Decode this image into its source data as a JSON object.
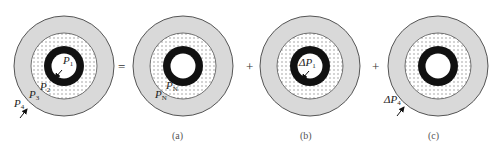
{
  "diagram": {
    "type": "superposition-of-pressures",
    "colors": {
      "outer_ring": "#d9d9d9",
      "outline": "#555555",
      "dotted_fill": "#ffffff",
      "dot": "#8a8a8a",
      "casing": "#111111",
      "bore": "#ffffff"
    },
    "operators": {
      "equals": "=",
      "plus1": "+",
      "plus2": "+"
    },
    "figures": [
      {
        "id": "original",
        "caption": "",
        "labels": {
          "inner": {
            "main": "P",
            "sub": "1"
          },
          "casing_outer": {
            "main": "P",
            "sub": "2"
          },
          "dotted_outer": {
            "main": "P",
            "sub": "3"
          },
          "outer": {
            "main": "P",
            "sub": "4"
          }
        }
      },
      {
        "id": "a",
        "caption": "(a)",
        "labels": {
          "casing_outer": {
            "main": "P",
            "sub": "N"
          },
          "dotted_outer": {
            "main": "P",
            "sub": "N"
          }
        }
      },
      {
        "id": "b",
        "caption": "(b)",
        "labels": {
          "inner": {
            "main": "ΔP",
            "sub": "1"
          }
        }
      },
      {
        "id": "c",
        "caption": "(c)",
        "labels": {
          "outer": {
            "main": "ΔP",
            "sub": "4"
          }
        }
      }
    ]
  }
}
